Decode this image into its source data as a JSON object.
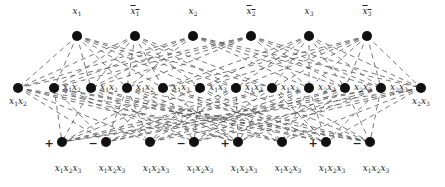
{
  "diagram": {
    "type": "layered-graph",
    "edge_style": "dashed",
    "node_color": "#111111",
    "edge_color": "#555555",
    "top_row": [
      {
        "label": "x1",
        "negated": false,
        "x": 77,
        "y": 36
      },
      {
        "label": "x1",
        "negated": true,
        "x": 135,
        "y": 36
      },
      {
        "label": "x2",
        "negated": false,
        "x": 193,
        "y": 36
      },
      {
        "label": "x2",
        "negated": true,
        "x": 251,
        "y": 36
      },
      {
        "label": "x3",
        "negated": false,
        "x": 309,
        "y": 36
      },
      {
        "label": "x3",
        "negated": true,
        "x": 367,
        "y": 36
      }
    ],
    "middle_row": [
      {
        "label": "x1x2",
        "x": 18,
        "y": 88,
        "label_pos": "below"
      },
      {
        "label": "x1x2",
        "x": 54,
        "y": 88,
        "label_pos": "right"
      },
      {
        "label": "x1x2",
        "x": 91,
        "y": 88,
        "label_pos": "right"
      },
      {
        "label": "x1x2",
        "x": 127,
        "y": 88,
        "label_pos": "right"
      },
      {
        "label": "x1x3",
        "x": 163,
        "y": 88,
        "label_pos": "right"
      },
      {
        "label": "x1x3",
        "x": 200,
        "y": 88,
        "label_pos": "right"
      },
      {
        "label": "x1x3",
        "x": 236,
        "y": 88,
        "label_pos": "right"
      },
      {
        "label": "x1x3",
        "x": 272,
        "y": 88,
        "label_pos": "right"
      },
      {
        "label": "x2x3",
        "x": 309,
        "y": 88,
        "label_pos": "right"
      },
      {
        "label": "x2x3",
        "x": 345,
        "y": 88,
        "label_pos": "right"
      },
      {
        "label": "x2x3",
        "x": 381,
        "y": 88,
        "label_pos": "right"
      },
      {
        "label": "x2x3",
        "x": 421,
        "y": 88,
        "label_pos": "below"
      }
    ],
    "bottom_row": [
      {
        "label": "x1x2x3",
        "sign": "+",
        "x": 62,
        "y": 142
      },
      {
        "label": "x1x2x3",
        "sign": "−",
        "x": 106,
        "y": 142
      },
      {
        "label": "x1x2x3",
        "sign": "",
        "x": 150,
        "y": 142
      },
      {
        "label": "x1x2x3",
        "sign": "−",
        "x": 194,
        "y": 142
      },
      {
        "label": "x1x2x3",
        "sign": "+",
        "x": 238,
        "y": 142
      },
      {
        "label": "x1x2x3",
        "sign": "",
        "x": 282,
        "y": 142
      },
      {
        "label": "x1x2x3",
        "sign": "+",
        "x": 326,
        "y": 142
      },
      {
        "label": "x1x2x3",
        "sign": "−",
        "x": 370,
        "y": 142
      }
    ]
  }
}
